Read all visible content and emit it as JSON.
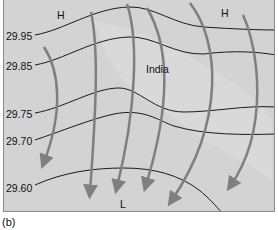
{
  "figure": {
    "caption": "(b)",
    "region_label": "India",
    "pressure_centers": [
      {
        "label": "H",
        "x": 56,
        "y": 10
      },
      {
        "label": "H",
        "x": 220,
        "y": 8
      },
      {
        "label": "L",
        "x": 119,
        "y": 198
      }
    ],
    "isobars": [
      {
        "value": "29.95",
        "label_y": 33
      },
      {
        "value": "29.85",
        "label_y": 63
      },
      {
        "value": "29.75",
        "label_y": 113
      },
      {
        "value": "29.70",
        "label_y": 139
      },
      {
        "value": "29.60",
        "label_y": 187
      }
    ],
    "colors": {
      "background": "#d3d3d3",
      "landmass": "#dcdcdc",
      "isobar": "#1a1a1a",
      "wind_arrow": "#7f7f7f"
    }
  }
}
